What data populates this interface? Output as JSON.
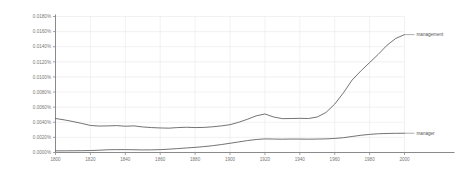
{
  "chart_data": {
    "type": "line",
    "title": "",
    "subtitle": "",
    "xlabel": "",
    "ylabel": "",
    "grid": true,
    "legend_position": "right-inline-labels",
    "xlim": [
      1800,
      2000
    ],
    "ylim": [
      0.0,
      0.018
    ],
    "x_ticks": [
      1800,
      1820,
      1840,
      1860,
      1880,
      1900,
      1920,
      1940,
      1960,
      1980,
      2000
    ],
    "x_tick_labels": [
      "1800",
      "1820",
      "1840",
      "1860",
      "1880",
      "1900",
      "1920",
      "1940",
      "1960",
      "1980",
      "2000"
    ],
    "y_ticks": [
      0.0,
      0.002,
      0.004,
      0.006,
      0.008,
      0.01,
      0.012,
      0.014,
      0.016,
      0.018
    ],
    "y_tick_labels": [
      "0.0000%",
      "0.0020%",
      "0.0040%",
      "0.0060%",
      "0.0080%",
      "0.0100%",
      "0.0120%",
      "0.0140%",
      "0.0160%",
      "0.0180%"
    ],
    "x": [
      1800,
      1805,
      1810,
      1815,
      1820,
      1825,
      1830,
      1835,
      1840,
      1845,
      1850,
      1855,
      1860,
      1865,
      1870,
      1875,
      1880,
      1885,
      1890,
      1895,
      1900,
      1905,
      1910,
      1915,
      1920,
      1925,
      1930,
      1935,
      1940,
      1945,
      1950,
      1955,
      1960,
      1965,
      1970,
      1975,
      1980,
      1985,
      1990,
      1995,
      2000
    ],
    "series": [
      {
        "name": "management",
        "color": "#5a5a5a",
        "label": "management",
        "values": [
          0.0045,
          0.00432,
          0.0041,
          0.00385,
          0.00358,
          0.0035,
          0.00352,
          0.00356,
          0.00348,
          0.00352,
          0.00338,
          0.0033,
          0.00325,
          0.00322,
          0.0033,
          0.00334,
          0.0033,
          0.00332,
          0.0034,
          0.00352,
          0.00368,
          0.004,
          0.0044,
          0.00485,
          0.0051,
          0.0047,
          0.00448,
          0.0045,
          0.00452,
          0.0045,
          0.0047,
          0.0053,
          0.0064,
          0.0079,
          0.0096,
          0.0108,
          0.0119,
          0.013,
          0.0142,
          0.0151,
          0.0156
        ]
      },
      {
        "name": "manager",
        "color": "#5a5a5a",
        "label": "manager",
        "values": [
          0.00022,
          0.00022,
          0.00023,
          0.00024,
          0.00026,
          0.0003,
          0.00036,
          0.00038,
          0.00038,
          0.00036,
          0.00034,
          0.00035,
          0.00038,
          0.00044,
          0.00052,
          0.0006,
          0.00068,
          0.00078,
          0.0009,
          0.00105,
          0.00122,
          0.0014,
          0.00158,
          0.00172,
          0.0018,
          0.00178,
          0.00176,
          0.00178,
          0.00178,
          0.00176,
          0.00178,
          0.0018,
          0.00186,
          0.00196,
          0.00212,
          0.00228,
          0.0024,
          0.00248,
          0.00252,
          0.00254,
          0.00255
        ]
      }
    ],
    "annotations": [
      {
        "name": "management-label",
        "text": "management",
        "at_x": 2000,
        "at_y": 0.0156
      },
      {
        "name": "manager-label",
        "text": "manager",
        "at_x": 2000,
        "at_y": 0.00255
      }
    ]
  }
}
